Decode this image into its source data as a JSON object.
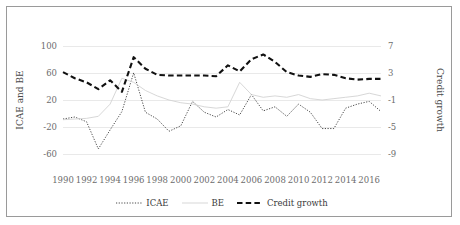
{
  "chart_data": {
    "type": "line",
    "title": "",
    "xlabel": "",
    "x": [
      1990,
      1991,
      1992,
      1993,
      1994,
      1995,
      1996,
      1997,
      1998,
      1999,
      2000,
      2001,
      2002,
      2003,
      2004,
      2005,
      2006,
      2007,
      2008,
      2009,
      2010,
      2011,
      2012,
      2013,
      2014,
      2015,
      2016,
      2017
    ],
    "xtick_labels": [
      "1990",
      "1992",
      "1994",
      "1996",
      "1998",
      "2000",
      "2002",
      "2004",
      "2006",
      "2008",
      "2010",
      "2012",
      "2014",
      "2016"
    ],
    "xtick_values": [
      1990,
      1992,
      1994,
      1996,
      1998,
      2000,
      2002,
      2004,
      2006,
      2008,
      2010,
      2012,
      2014,
      2016
    ],
    "grid": "horizontal",
    "legend_position": "bottom-center",
    "axes": [
      {
        "id": "left",
        "label": "ICAE and BE",
        "ylim": [
          -80,
          120
        ],
        "ticks": [
          100,
          60,
          20,
          -20,
          -60
        ],
        "tick_labels": [
          "100",
          "60",
          "20",
          "-20",
          "-60"
        ]
      },
      {
        "id": "right",
        "label": "Credit growth",
        "ylim": [
          -11,
          9
        ],
        "ticks": [
          7,
          3,
          -1,
          -5,
          -9
        ],
        "tick_labels": [
          "7",
          "3",
          "-1",
          "-5",
          "-9"
        ]
      }
    ],
    "series": [
      {
        "name": "ICAE",
        "axis": "left",
        "style": "dotted",
        "color": "#333333",
        "values": [
          -8,
          -5,
          -12,
          -52,
          -24,
          3,
          60,
          2,
          -8,
          -26,
          -18,
          18,
          2,
          -5,
          6,
          -2,
          28,
          4,
          10,
          -4,
          14,
          2,
          -22,
          -22,
          8,
          14,
          18,
          3
        ]
      },
      {
        "name": "BE",
        "axis": "left",
        "style": "solid",
        "color": "#d2d2d2",
        "values": [
          -9,
          -8,
          -7,
          -4,
          14,
          52,
          46,
          34,
          26,
          20,
          16,
          14,
          10,
          8,
          10,
          46,
          28,
          24,
          26,
          24,
          28,
          22,
          20,
          22,
          24,
          26,
          30,
          26
        ]
      },
      {
        "name": "Credit growth",
        "axis": "right",
        "style": "dashed",
        "color": "#111111",
        "values": [
          3.1,
          2.2,
          1.6,
          0.6,
          1.9,
          0.2,
          5.3,
          3.6,
          2.7,
          2.6,
          2.6,
          2.6,
          2.6,
          2.5,
          4.1,
          3.2,
          5.0,
          5.7,
          4.6,
          3.1,
          2.6,
          2.4,
          2.8,
          2.7,
          2.2,
          2.0,
          2.1,
          2.1
        ]
      }
    ]
  },
  "legend": {
    "items": [
      {
        "label": "ICAE",
        "style": "dotted"
      },
      {
        "label": "BE",
        "style": "solid"
      },
      {
        "label": "Credit growth",
        "style": "dashed"
      }
    ]
  }
}
